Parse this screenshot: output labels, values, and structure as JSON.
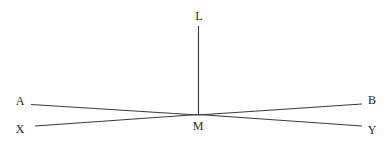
{
  "diagram": {
    "labels": {
      "L": "L",
      "A": "A",
      "B": "B",
      "X": "X",
      "Y": "Y",
      "M": "M"
    },
    "segments": [
      {
        "id": "LM",
        "from": "L",
        "to": "M"
      },
      {
        "id": "AM",
        "from": "A",
        "to": "M"
      },
      {
        "id": "MB",
        "from": "M",
        "to": "B"
      },
      {
        "id": "XM",
        "from": "X",
        "to": "M"
      },
      {
        "id": "MY",
        "from": "M",
        "to": "Y"
      }
    ],
    "colors": {
      "line": "#3a3a3a",
      "text": "#2a2a2a",
      "background": "#ffffff"
    }
  }
}
